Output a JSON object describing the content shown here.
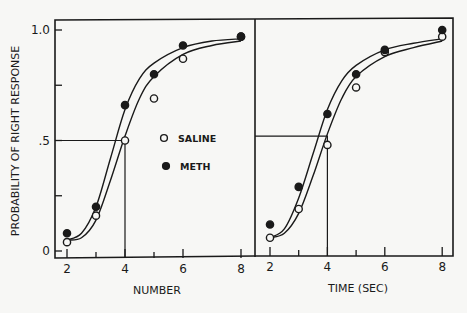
{
  "chart_data": {
    "type": "scatter",
    "ylabel": "PROBABILITY OF RIGHT RESPONSE",
    "ylim": [
      0,
      1.0
    ],
    "yticks": [
      {
        "value": 0,
        "label": "0"
      },
      {
        "value": 0.25,
        "label": ""
      },
      {
        "value": 0.5,
        "label": ".5"
      },
      {
        "value": 0.75,
        "label": ""
      },
      {
        "value": 1.0,
        "label": "1.0"
      }
    ],
    "legend": [
      {
        "name": "SALINE",
        "marker": "open-circle"
      },
      {
        "name": "METH",
        "marker": "filled-circle"
      }
    ],
    "panels": [
      {
        "xlabel": "NUMBER",
        "xlim": [
          1.6,
          8.4
        ],
        "xticks": [
          2,
          3,
          4,
          5,
          6,
          8
        ],
        "xticklabels": [
          "2",
          "",
          "4",
          "",
          "6",
          "8"
        ],
        "series": [
          {
            "name": "SALINE",
            "x": [
              2,
              3,
              4,
              5,
              6,
              8
            ],
            "y": [
              0.04,
              0.16,
              0.5,
              0.69,
              0.87,
              0.97
            ]
          },
          {
            "name": "METH",
            "x": [
              2,
              3,
              4,
              5,
              6,
              8
            ],
            "y": [
              0.08,
              0.2,
              0.66,
              0.8,
              0.93,
              0.97
            ]
          }
        ],
        "fit_curves": [
          {
            "name": "METH",
            "x": [
              2,
              2.5,
              3,
              3.5,
              4,
              4.5,
              5,
              6,
              7,
              8
            ],
            "y": [
              0.05,
              0.08,
              0.2,
              0.42,
              0.64,
              0.78,
              0.85,
              0.92,
              0.95,
              0.96
            ]
          },
          {
            "name": "SALINE",
            "x": [
              2,
              2.5,
              3,
              3.5,
              4,
              4.5,
              5,
              6,
              7,
              8
            ],
            "y": [
              0.05,
              0.06,
              0.14,
              0.32,
              0.52,
              0.69,
              0.79,
              0.89,
              0.93,
              0.95
            ]
          }
        ],
        "threshold": {
          "x": 4,
          "y": 0.5
        }
      },
      {
        "xlabel": "TIME (SEC)",
        "xlim": [
          1.5,
          8.4
        ],
        "xticks": [
          2,
          3,
          4,
          5,
          6,
          8
        ],
        "xticklabels": [
          "2",
          "",
          "4",
          "",
          "6",
          "8"
        ],
        "series": [
          {
            "name": "SALINE",
            "x": [
              2,
              3,
              4,
              5,
              6,
              8
            ],
            "y": [
              0.06,
              0.19,
              0.48,
              0.74,
              0.9,
              0.97
            ]
          },
          {
            "name": "METH",
            "x": [
              2,
              3,
              4,
              5,
              6,
              8
            ],
            "y": [
              0.12,
              0.29,
              0.62,
              0.8,
              0.91,
              1.0
            ]
          }
        ],
        "fit_curves": [
          {
            "name": "METH",
            "x": [
              2,
              2.5,
              3,
              3.5,
              4,
              4.5,
              5,
              6,
              7,
              8
            ],
            "y": [
              0.06,
              0.1,
              0.24,
              0.44,
              0.64,
              0.77,
              0.84,
              0.91,
              0.94,
              0.96
            ]
          },
          {
            "name": "SALINE",
            "x": [
              2,
              2.5,
              3,
              3.5,
              4,
              4.5,
              5,
              6,
              7,
              8
            ],
            "y": [
              0.06,
              0.08,
              0.17,
              0.34,
              0.53,
              0.69,
              0.79,
              0.88,
              0.92,
              0.95
            ]
          }
        ],
        "threshold": {
          "x": 4,
          "y": 0.52
        }
      }
    ]
  }
}
